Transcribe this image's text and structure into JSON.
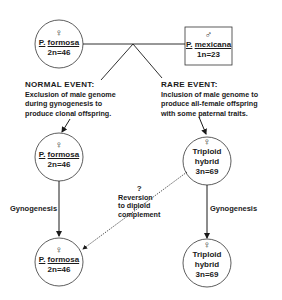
{
  "diagram": {
    "nodes": {
      "top_left": {
        "symbol": "♀",
        "genus": "P.",
        "species": "formosa",
        "ploidy": "2n=46",
        "shape": "circle"
      },
      "top_right": {
        "symbol": "♂",
        "genus": "P.",
        "species": "mexicana",
        "ploidy": "1n=23",
        "shape": "box"
      },
      "mid_left": {
        "symbol": "♀",
        "genus": "P.",
        "species": "formosa",
        "ploidy": "2n=46",
        "shape": "circle"
      },
      "mid_right": {
        "symbol": "♀",
        "line1": "Triploid",
        "line2": "hybrid",
        "ploidy": "3n=69",
        "shape": "circle"
      },
      "bottom_left": {
        "symbol": "♀",
        "genus": "P.",
        "species": "formosa",
        "ploidy": "2n=46",
        "shape": "circle"
      },
      "bottom_right": {
        "symbol": "♀",
        "line1": "Triploid",
        "line2": "hybrid",
        "ploidy": "3n=69",
        "shape": "circle"
      }
    },
    "events": {
      "normal": {
        "title": "NORMAL EVENT:",
        "lines": [
          "Exclusion of male genome",
          "during gynogenesis  to",
          "produce clonal offspring."
        ]
      },
      "rare": {
        "title": "RARE  EVENT:",
        "lines": [
          "Inclusion of male genome to",
          "produce all-female offspring",
          "with some paternal traits."
        ]
      }
    },
    "edges": {
      "left_gynogenesis": "Gynogenesis",
      "right_gynogenesis": "Gynogenesis",
      "reversion": {
        "question": "?",
        "lines": [
          "Reversion",
          "to diploid",
          "complement"
        ]
      }
    },
    "colors": {
      "ink": "#1a1a1a",
      "background": "#ffffff"
    }
  }
}
